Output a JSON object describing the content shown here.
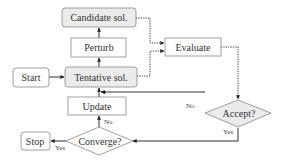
{
  "diagram": {
    "type": "flowchart",
    "colors": {
      "gray_fill": "#ebebeb",
      "white_fill": "#ffffff",
      "stroke": "#888888",
      "edge": "#333333",
      "text": "#333333"
    },
    "nodes": {
      "candidate": {
        "label": "Candidate sol.",
        "shape": "rounded-rect",
        "fill": "gray"
      },
      "perturb": {
        "label": "Perturb",
        "shape": "rect",
        "fill": "white"
      },
      "start": {
        "label": "Start",
        "shape": "rounded-rect",
        "fill": "white"
      },
      "tentative": {
        "label": "Tentative sol.",
        "shape": "rounded-rect",
        "fill": "gray"
      },
      "evaluate": {
        "label": "Evaluate",
        "shape": "rect",
        "fill": "white"
      },
      "accept": {
        "label": "Accept?",
        "shape": "diamond",
        "fill": "gray"
      },
      "update": {
        "label": "Update",
        "shape": "rect",
        "fill": "white"
      },
      "converge": {
        "label": "Converge?",
        "shape": "diamond",
        "fill": "white"
      },
      "stop": {
        "label": "Stop",
        "shape": "rounded-rect",
        "fill": "white"
      }
    },
    "edges": [
      {
        "from": "start",
        "to": "tentative",
        "style": "solid",
        "label": ""
      },
      {
        "from": "tentative",
        "to": "perturb",
        "style": "solid",
        "label": ""
      },
      {
        "from": "perturb",
        "to": "candidate",
        "style": "solid",
        "label": ""
      },
      {
        "from": "candidate",
        "to": "evaluate",
        "style": "dotted",
        "label": ""
      },
      {
        "from": "tentative",
        "to": "evaluate",
        "style": "dotted",
        "label": ""
      },
      {
        "from": "evaluate",
        "to": "accept",
        "style": "dotted",
        "label": ""
      },
      {
        "from": "accept",
        "to": "tentative",
        "style": "solid",
        "label": "No"
      },
      {
        "from": "accept",
        "to": "converge",
        "style": "solid",
        "label": "Yes"
      },
      {
        "from": "converge",
        "to": "update",
        "style": "solid",
        "label": "No"
      },
      {
        "from": "update",
        "to": "tentative",
        "style": "solid",
        "label": ""
      },
      {
        "from": "converge",
        "to": "stop",
        "style": "solid",
        "label": "Yes"
      }
    ],
    "edge_labels": {
      "accept_no": "No",
      "accept_yes": "Yes",
      "converge_no": "No",
      "converge_yes": "Yes"
    }
  }
}
